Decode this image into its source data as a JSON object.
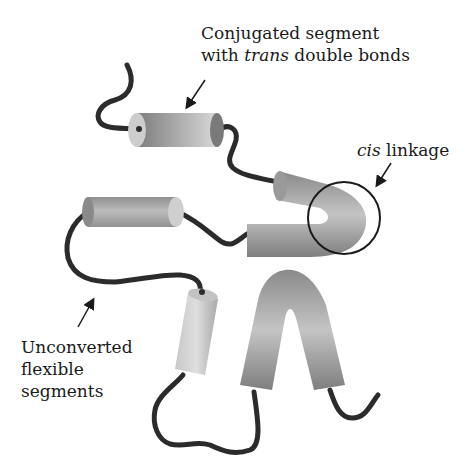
{
  "labels": {
    "conjugated": {
      "line1": "Conjugated segment",
      "line2_prefix": "with ",
      "line2_italic": "trans",
      "line2_suffix": " double bonds"
    },
    "cis": {
      "italic": "cis",
      "suffix": " linkage"
    },
    "unconverted": {
      "line1": "Unconverted",
      "line2": "flexible",
      "line3": "segments"
    }
  },
  "colors": {
    "chain": "#2b2b2b",
    "cylinder_dark": "#7a7a7a",
    "cylinder_light": "#d4d4d4",
    "text": "#1a1a1a"
  }
}
